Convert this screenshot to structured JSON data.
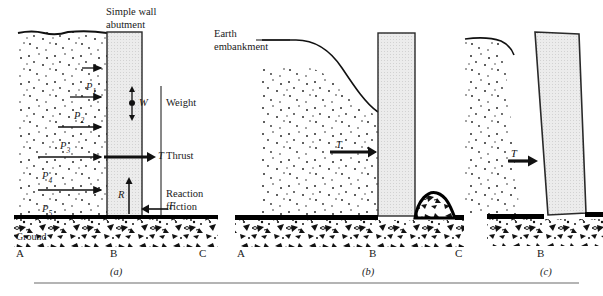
{
  "figure": {
    "type": "engineering-diagram",
    "bottom_rule": true
  },
  "panels": [
    {
      "id": "a",
      "caption": "(a)",
      "title": "Simple wall abutment",
      "ground_label": "Ground",
      "points": [
        "A",
        "B",
        "C"
      ],
      "force_labels": [
        {
          "symbol": "P",
          "sub": "1",
          "name": "Thrust"
        },
        {
          "symbol": "P",
          "sub": "2",
          "name": "Thrust"
        },
        {
          "symbol": "P",
          "sub": "3",
          "name": "Thrust"
        },
        {
          "symbol": "P",
          "sub": "4",
          "name": "Thrust"
        },
        {
          "symbol": "P",
          "sub": "5",
          "name": "Thrust"
        }
      ],
      "annotations": [
        {
          "symbol": "W",
          "text": "Weight"
        },
        {
          "symbol": "T",
          "text": "Thrust"
        },
        {
          "symbol": "R",
          "text": ""
        },
        {
          "symbol": "F",
          "text": "Reaction\nfriction"
        }
      ],
      "reaction_text_line1": "Reaction",
      "reaction_text_line2": "friction"
    },
    {
      "id": "b",
      "caption": "(b)",
      "title": "Earth\nembankment",
      "points": [
        "A",
        "B",
        "C"
      ],
      "annotations": [
        {
          "symbol": "T",
          "text": ""
        }
      ]
    },
    {
      "id": "c",
      "caption": "(c)",
      "title": "",
      "points": [
        "B"
      ],
      "annotations": [
        {
          "symbol": "T",
          "text": ""
        }
      ]
    }
  ],
  "text": {
    "title_a_line1": "Simple wall",
    "title_a_line2": "abutment",
    "title_b_line1": "Earth",
    "title_b_line2": "embankment",
    "ground": "Ground",
    "weight": "Weight",
    "thrust": "Thrust",
    "reaction1": "Reaction",
    "reaction2": "friction",
    "p1": "P",
    "p2": "P",
    "p3": "P",
    "p4": "P",
    "p5": "P",
    "s1": "1",
    "s2": "2",
    "s3": "3",
    "s4": "4",
    "s5": "5",
    "sym_W": "W",
    "sym_T": "T",
    "sym_R": "R",
    "sym_F": "F",
    "pt_A": "A",
    "pt_B": "B",
    "pt_C": "C",
    "cap_a": "(a)",
    "cap_b": "(b)",
    "cap_c": "(c)"
  },
  "colors": {
    "ink": "#1a1a1a",
    "wall_fill": "#e8e8e8",
    "wall_stroke": "#2a2a2a",
    "ground_line": "#000000",
    "rule": "#6a6a6a",
    "soil_dot": "#2b2b2b"
  }
}
